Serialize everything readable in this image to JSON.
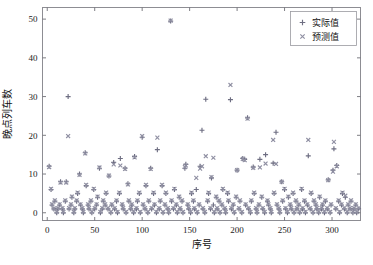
{
  "figure": {
    "background_color": "#ffffff",
    "frame_color": "#8d8d93"
  },
  "axis": {
    "x_title": "序号",
    "y_title": "晚点列车数",
    "x_ticks": [
      "0",
      "50",
      "100",
      "150",
      "200",
      "250",
      "300"
    ],
    "y_ticks": [
      "0",
      "10",
      "20",
      "30",
      "40",
      "50"
    ]
  },
  "legend": {
    "entries": [
      {
        "label": "实际值",
        "marker": "plus-marker",
        "color": "#6e6e82"
      },
      {
        "label": "预测值",
        "marker": "cross-marker",
        "color": "#8f8fa2"
      }
    ]
  },
  "chart_data": {
    "type": "scatter",
    "title": "",
    "xlabel": "序号",
    "ylabel": "晚点列车数",
    "xlim": [
      -5,
      330
    ],
    "ylim": [
      -2,
      53
    ],
    "xticks": [
      0,
      50,
      100,
      150,
      200,
      250,
      300
    ],
    "yticks": [
      0,
      10,
      20,
      30,
      40,
      50
    ],
    "grid": false,
    "legend_position": "upper right",
    "series": [
      {
        "name": "实际值",
        "marker": "+",
        "color": "#6e6e82",
        "x": [
          2,
          4,
          5,
          7,
          8,
          10,
          11,
          13,
          14,
          16,
          17,
          19,
          20,
          22,
          23,
          25,
          26,
          28,
          29,
          31,
          32,
          34,
          35,
          37,
          38,
          40,
          41,
          43,
          44,
          46,
          47,
          49,
          50,
          52,
          53,
          55,
          56,
          58,
          59,
          61,
          62,
          64,
          65,
          67,
          68,
          70,
          71,
          73,
          74,
          76,
          77,
          79,
          80,
          82,
          83,
          85,
          86,
          88,
          89,
          91,
          92,
          94,
          95,
          97,
          98,
          100,
          101,
          103,
          104,
          106,
          107,
          109,
          110,
          112,
          113,
          115,
          116,
          118,
          119,
          121,
          122,
          124,
          125,
          127,
          128,
          130,
          131,
          133,
          134,
          136,
          137,
          139,
          140,
          142,
          143,
          145,
          146,
          148,
          149,
          151,
          152,
          154,
          155,
          157,
          158,
          160,
          161,
          163,
          164,
          166,
          167,
          169,
          170,
          172,
          173,
          175,
          176,
          178,
          179,
          181,
          182,
          184,
          185,
          187,
          188,
          190,
          191,
          193,
          194,
          196,
          197,
          199,
          200,
          202,
          203,
          205,
          206,
          208,
          209,
          211,
          212,
          214,
          215,
          217,
          218,
          220,
          221,
          223,
          224,
          226,
          227,
          229,
          230,
          232,
          233,
          235,
          236,
          238,
          239,
          241,
          242,
          244,
          245,
          247,
          248,
          250,
          251,
          253,
          254,
          256,
          257,
          259,
          260,
          262,
          263,
          265,
          266,
          268,
          269,
          271,
          272,
          274,
          275,
          277,
          278,
          280,
          281,
          283,
          284,
          286,
          287,
          289,
          290,
          292,
          293,
          295,
          296,
          298,
          299,
          301,
          302,
          304,
          305,
          307,
          308,
          310,
          311,
          313,
          314,
          316,
          317,
          319,
          320,
          322,
          323,
          325,
          326,
          328
        ],
        "y": [
          12,
          6,
          2,
          1,
          3,
          0,
          1,
          2,
          8,
          1,
          0,
          3,
          8,
          30,
          1,
          2,
          4,
          0,
          1,
          3,
          5,
          10,
          2,
          1,
          0,
          15.5,
          7,
          2,
          1,
          3,
          0,
          6,
          1,
          2,
          4,
          11.5,
          0,
          1,
          3,
          2,
          5,
          1,
          9.5,
          0,
          2,
          13,
          1,
          3,
          0,
          5,
          14,
          2,
          1,
          11.5,
          0,
          7.5,
          3,
          1,
          2,
          0,
          14.5,
          1,
          3,
          5,
          0,
          19.5,
          2,
          1,
          7,
          0,
          3,
          11.5,
          1,
          5,
          2,
          0,
          16.3,
          1,
          3,
          7,
          0,
          2,
          5,
          1,
          0,
          49.5,
          3,
          1,
          6,
          2,
          0,
          4,
          1,
          3,
          0,
          11.5,
          12.5,
          2,
          1,
          0,
          5,
          3,
          1,
          6,
          0,
          2,
          12,
          21.3,
          1,
          0,
          29.3,
          3,
          5,
          1,
          9,
          2,
          0,
          4,
          1,
          3,
          0,
          2,
          6,
          1,
          0,
          5,
          3,
          29.2,
          1,
          2,
          0,
          4,
          11,
          1,
          3,
          0,
          14,
          13.8,
          2,
          24.5,
          1,
          0,
          3,
          11.8,
          5,
          1,
          0,
          2,
          13.8,
          4,
          1,
          0,
          15,
          3,
          2,
          1,
          0,
          12.8,
          5,
          20.8,
          2,
          1,
          0,
          8,
          3,
          6,
          1,
          0,
          4,
          2,
          1,
          5,
          0,
          3,
          1,
          2,
          0,
          6,
          1,
          3,
          0,
          2,
          14.7,
          1,
          5,
          0,
          3,
          2,
          1,
          0,
          4,
          1,
          2,
          0,
          3,
          1,
          8.5,
          0,
          2,
          11,
          16.5,
          1,
          12.2,
          3,
          0,
          2,
          5,
          1,
          4,
          0,
          2,
          1,
          3,
          0,
          1,
          2,
          0,
          1
        ]
      },
      {
        "name": "预测值",
        "marker": "x",
        "color": "#8f8fa2",
        "x": [
          2,
          4,
          5,
          7,
          8,
          10,
          11,
          13,
          14,
          16,
          17,
          19,
          20,
          22,
          23,
          25,
          26,
          28,
          29,
          31,
          32,
          34,
          35,
          37,
          38,
          40,
          41,
          43,
          44,
          46,
          47,
          49,
          50,
          52,
          53,
          55,
          56,
          58,
          59,
          61,
          62,
          64,
          65,
          67,
          68,
          70,
          71,
          73,
          74,
          76,
          77,
          79,
          80,
          82,
          83,
          85,
          86,
          88,
          89,
          91,
          92,
          94,
          95,
          97,
          98,
          100,
          101,
          103,
          104,
          106,
          107,
          109,
          110,
          112,
          113,
          115,
          116,
          118,
          119,
          121,
          122,
          124,
          125,
          127,
          128,
          130,
          131,
          133,
          134,
          136,
          137,
          139,
          140,
          142,
          143,
          145,
          146,
          148,
          149,
          151,
          152,
          154,
          155,
          157,
          158,
          160,
          161,
          163,
          164,
          166,
          167,
          169,
          170,
          172,
          173,
          175,
          176,
          178,
          179,
          181,
          182,
          184,
          185,
          187,
          188,
          190,
          191,
          193,
          194,
          196,
          197,
          199,
          200,
          202,
          203,
          205,
          206,
          208,
          209,
          211,
          212,
          214,
          215,
          217,
          218,
          220,
          221,
          223,
          224,
          226,
          227,
          229,
          230,
          232,
          233,
          235,
          236,
          238,
          239,
          241,
          242,
          244,
          245,
          247,
          248,
          250,
          251,
          253,
          254,
          256,
          257,
          259,
          260,
          262,
          263,
          265,
          266,
          268,
          269,
          271,
          272,
          274,
          275,
          277,
          278,
          280,
          281,
          283,
          284,
          286,
          287,
          289,
          290,
          292,
          293,
          295,
          296,
          298,
          299,
          301,
          302,
          304,
          305,
          307,
          308,
          310,
          311,
          313,
          314,
          316,
          317,
          319,
          320,
          322,
          323,
          325,
          326,
          328
        ],
        "y": [
          11.8,
          6.2,
          2.2,
          1.1,
          3.2,
          0.2,
          1.2,
          2.2,
          7.8,
          1.2,
          0.2,
          3.2,
          7.8,
          19.8,
          1.2,
          2.2,
          4.2,
          0.2,
          1.2,
          3.2,
          5.2,
          9.8,
          2.2,
          1.2,
          0.2,
          15.3,
          7.2,
          2.2,
          1.2,
          3.2,
          0.2,
          6.2,
          1.2,
          2.2,
          4.2,
          11.7,
          0.2,
          1.2,
          3.2,
          2.2,
          5.2,
          1.2,
          9.6,
          0.2,
          2.2,
          12.5,
          1.2,
          3.2,
          0.2,
          5.2,
          12.2,
          2.2,
          1.2,
          11.3,
          0.2,
          7.3,
          3.2,
          1.2,
          2.2,
          0.2,
          14.3,
          1.2,
          3.2,
          5.2,
          0.2,
          19.8,
          2.2,
          1.2,
          7.2,
          0.2,
          3.2,
          11.3,
          1.2,
          5.2,
          2.2,
          0.2,
          19.4,
          1.2,
          3.2,
          7.2,
          0.2,
          2.2,
          5.2,
          1.2,
          0.2,
          49.6,
          3.2,
          1.2,
          6.2,
          2.2,
          0.2,
          4.2,
          1.2,
          3.2,
          0.2,
          11.8,
          12.2,
          2.2,
          1.2,
          0.2,
          5.2,
          3.2,
          1.2,
          9.0,
          0.2,
          2.2,
          11.4,
          12.0,
          1.2,
          0.2,
          14.6,
          3.2,
          5.2,
          1.2,
          9.2,
          14.2,
          0.2,
          4.2,
          1.2,
          3.2,
          0.2,
          2.2,
          6.2,
          1.2,
          0.2,
          5.2,
          3.2,
          33.0,
          1.2,
          2.2,
          0.2,
          4.2,
          11.0,
          1.2,
          3.2,
          0.2,
          13.9,
          13.6,
          2.2,
          24.3,
          1.2,
          0.2,
          3.2,
          11.6,
          5.2,
          1.2,
          0.2,
          2.2,
          11.7,
          4.2,
          1.2,
          0.2,
          12.7,
          3.2,
          2.2,
          1.2,
          0.2,
          18.8,
          5.2,
          12.6,
          2.2,
          1.2,
          0.2,
          8.0,
          3.2,
          6.2,
          1.2,
          0.2,
          4.2,
          2.2,
          1.2,
          5.2,
          0.2,
          3.2,
          1.2,
          2.2,
          0.2,
          6.2,
          1.2,
          3.2,
          0.2,
          2.2,
          18.8,
          1.2,
          5.2,
          0.2,
          3.2,
          2.2,
          1.2,
          0.2,
          4.2,
          1.2,
          2.2,
          0.2,
          3.2,
          1.2,
          8.4,
          0.2,
          2.2,
          10.6,
          18.3,
          1.2,
          12.0,
          3.2,
          0.2,
          2.2,
          5.2,
          1.2,
          4.4,
          0.2,
          2.2,
          1.2,
          3.2,
          0.2,
          1.2,
          2.2,
          0.2,
          1.2
        ]
      }
    ]
  }
}
